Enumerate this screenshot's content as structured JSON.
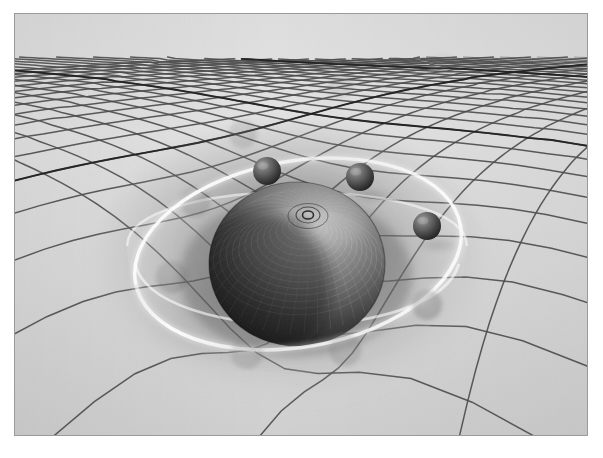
{
  "figure": {
    "frame": {
      "margin_left": 14,
      "margin_top": 13,
      "width": 574,
      "height": 423,
      "border_color": "#9a9a9a",
      "page_background": "#ffffff"
    }
  },
  "palette": {
    "plane_light": "#e3e3e3",
    "plane_mid": "#d2d2d2",
    "plane_dark": "#b4b4b4",
    "grid_line": "#4a4a4a",
    "grid_line_strong": "#1e1e1e",
    "well_shadow": "#8d8d8d",
    "well_deep": "#3a3a3a",
    "sphere_light": "#9c9c9c",
    "sphere_mid": "#5d5d5d",
    "sphere_dark": "#1b1b1b",
    "orbit_ring": "#f4f4f4",
    "satellite_light": "#8a8a8a",
    "satellite_dark": "#242424",
    "ghost_tint": "#6f6f6f"
  },
  "scene": {
    "viewbox": "0 0 572 421",
    "plane": {
      "name": "spacetime-grid",
      "description": "perspective square lattice receding toward upper horizon",
      "cells_across": 34,
      "cells_deep": 26,
      "horizon_y": 6,
      "grid_stroke_width_near": 1.5,
      "grid_stroke_width_far": 0.55,
      "accent_lines": 3
    },
    "well": {
      "name": "gravity-well",
      "center_x": 276,
      "center_y": 242,
      "radius_x": 176,
      "radius_y": 124,
      "depth": 96,
      "rim_highlight": true
    },
    "central_body": {
      "name": "massive-sphere",
      "center_x": 282,
      "center_y": 250,
      "radius_x": 88,
      "radius_y": 82,
      "texture": "wireframe-mesh",
      "latitude_rings": 15,
      "longitude_lines": 42,
      "pole_x": 293,
      "pole_y": 200,
      "light_from": "upper-right"
    },
    "orbit": {
      "name": "orbit-ring",
      "center_x": 283,
      "center_y": 240,
      "radius_x": 165,
      "radius_y": 93,
      "tilt_deg": -10,
      "stroke_width": 3,
      "opacity": 0.85
    },
    "satellites": [
      {
        "id": "sat-1",
        "x": 252,
        "y": 157,
        "r": 14,
        "opacity": 1.0,
        "label": "orbiting body"
      },
      {
        "id": "sat-2",
        "x": 345,
        "y": 163,
        "r": 14,
        "opacity": 1.0,
        "label": "orbiting body"
      },
      {
        "id": "sat-3",
        "x": 412,
        "y": 212,
        "r": 14,
        "opacity": 1.0,
        "label": "orbiting body"
      }
    ],
    "ghosts": [
      {
        "id": "ghost-1",
        "x": 412,
        "y": 291,
        "r": 15,
        "opacity": 0.32,
        "label": "motion trail"
      },
      {
        "id": "ghost-2",
        "x": 330,
        "y": 336,
        "r": 16,
        "opacity": 0.22,
        "label": "motion trail"
      },
      {
        "id": "ghost-3",
        "x": 232,
        "y": 339,
        "r": 16,
        "opacity": 0.2,
        "label": "motion trail"
      },
      {
        "id": "ghost-4",
        "x": 157,
        "y": 263,
        "r": 16,
        "opacity": 0.26,
        "label": "motion trail"
      },
      {
        "id": "ghost-5",
        "x": 180,
        "y": 188,
        "r": 15,
        "opacity": 0.24,
        "label": "motion trail"
      },
      {
        "id": "ghost-6",
        "x": 228,
        "y": 120,
        "r": 14,
        "opacity": 0.2,
        "label": "motion trail"
      },
      {
        "id": "ghost-7",
        "x": 325,
        "y": 71,
        "r": 13,
        "opacity": 0.13,
        "label": "motion trail"
      },
      {
        "id": "ghost-8",
        "x": 428,
        "y": 52,
        "r": 12,
        "opacity": 0.09,
        "label": "motion trail"
      }
    ],
    "cast_shadows": [
      {
        "id": "shadow-main",
        "x": 236,
        "y": 300,
        "rx": 112,
        "ry": 56,
        "opacity": 0.3
      },
      {
        "id": "shadow-sat-1",
        "x": 262,
        "y": 176,
        "rx": 22,
        "ry": 9,
        "opacity": 0.26
      },
      {
        "id": "shadow-sat-2",
        "x": 356,
        "y": 182,
        "rx": 22,
        "ry": 9,
        "opacity": 0.26
      },
      {
        "id": "shadow-sat-3",
        "x": 423,
        "y": 231,
        "rx": 22,
        "ry": 9,
        "opacity": 0.26
      }
    ]
  }
}
